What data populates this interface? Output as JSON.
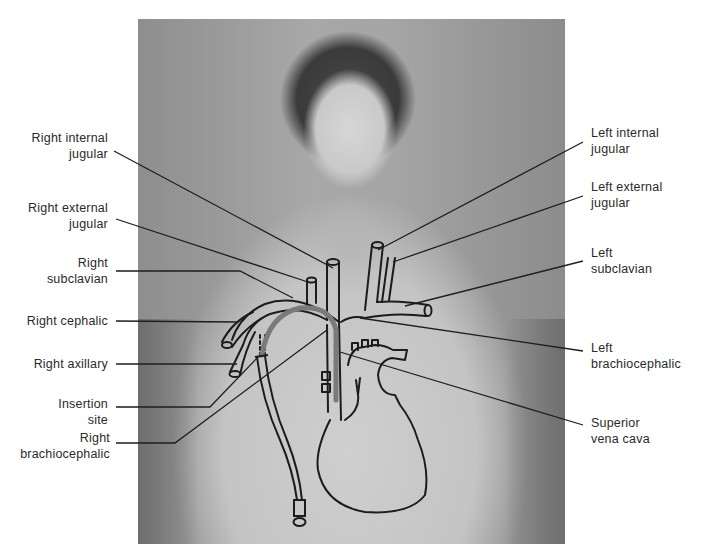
{
  "figure": {
    "photo_description": "Black-and-white photo of a shirtless man with overlaid vein diagram"
  },
  "labels_right_side": [
    {
      "id": "right-internal-jugular",
      "line1": "Right internal",
      "line2": "jugular"
    },
    {
      "id": "right-external-jugular",
      "line1": "Right external",
      "line2": "jugular"
    },
    {
      "id": "right-subclavian",
      "line1": "Right",
      "line2": "subclavian"
    },
    {
      "id": "right-cephalic",
      "line1": "Right cephalic",
      "line2": ""
    },
    {
      "id": "right-axillary",
      "line1": "Right axillary",
      "line2": ""
    },
    {
      "id": "insertion-site",
      "line1": "Insertion",
      "line2": "site"
    },
    {
      "id": "right-brachiocephalic",
      "line1": "Right",
      "line2": "brachiocephalic"
    }
  ],
  "labels_left_side": [
    {
      "id": "left-internal-jugular",
      "line1": "Left internal",
      "line2": "jugular"
    },
    {
      "id": "left-external-jugular",
      "line1": "Left external",
      "line2": "jugular"
    },
    {
      "id": "left-subclavian",
      "line1": "Left",
      "line2": "subclavian"
    },
    {
      "id": "left-brachiocephalic",
      "line1": "Left",
      "line2": "brachiocephalic"
    },
    {
      "id": "superior-vena-cava",
      "line1": "Superior",
      "line2": "vena cava"
    }
  ],
  "colors": {
    "background": "#ffffff",
    "text": "#2a2a2a",
    "leader_line": "#1e1e1e",
    "catheter": "#7a7a7a"
  }
}
